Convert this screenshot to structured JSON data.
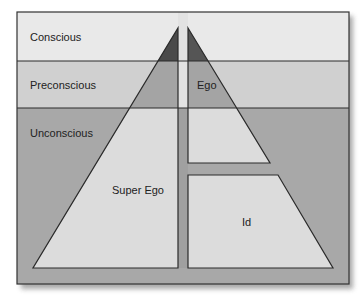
{
  "diagram": {
    "levels": [
      {
        "id": "conscious",
        "label": "Conscious"
      },
      {
        "id": "preconscious",
        "label": "Preconscious"
      },
      {
        "id": "unconscious",
        "label": "Unconscious"
      }
    ],
    "structures": [
      {
        "id": "super_ego",
        "label": "Super Ego"
      },
      {
        "id": "ego",
        "label": "Ego"
      },
      {
        "id": "id",
        "label": "Id"
      }
    ],
    "colors": {
      "conscious_band": "#e8e8e8",
      "preconscious_band": "#cfcfcf",
      "unconscious_band": "#a9a9a9",
      "shape_fill_light": "#dcdcdc",
      "shape_fill_mid": "#a6a6a6",
      "shape_fill_dark": "#4a4a4a",
      "stroke": "#2a2a2a",
      "shadow": "#9a9a9a"
    }
  }
}
